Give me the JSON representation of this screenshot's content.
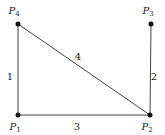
{
  "diagram": {
    "type": "graph",
    "nodes": [
      {
        "id": "P1",
        "name": "P",
        "sub": "1",
        "x": 18,
        "y": 115,
        "lx": 18,
        "ly": 130
      },
      {
        "id": "P2",
        "name": "P",
        "sub": "2",
        "x": 150,
        "y": 115,
        "lx": 150,
        "ly": 130
      },
      {
        "id": "P3",
        "name": "P",
        "sub": "3",
        "x": 151,
        "y": 24,
        "lx": 151,
        "ly": 14
      },
      {
        "id": "P4",
        "name": "P",
        "sub": "4",
        "x": 18,
        "y": 24,
        "lx": 17,
        "ly": 14
      }
    ],
    "edges": [
      {
        "label": "1",
        "from": "P1",
        "to": "P4",
        "lx": 10,
        "ly": 80
      },
      {
        "label": "2",
        "from": "P2",
        "to": "P3",
        "lx": 154,
        "ly": 80
      },
      {
        "label": "3",
        "from": "P1",
        "to": "P2",
        "lx": 77,
        "ly": 130
      },
      {
        "label": "4",
        "from": "P4",
        "to": "P2",
        "lx": 78,
        "ly": 60
      }
    ]
  }
}
